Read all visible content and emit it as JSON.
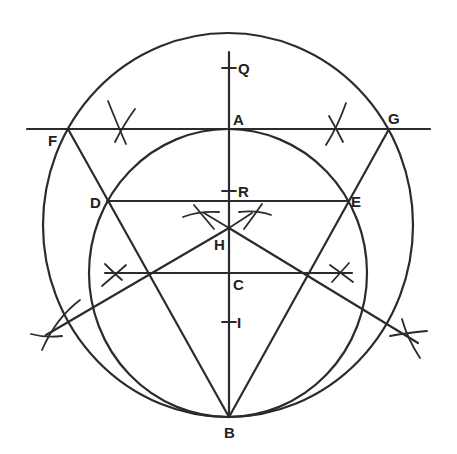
{
  "figure": {
    "stroke_color": "#2b2b2b",
    "background": "#ffffff"
  },
  "labels": {
    "Q": "Q",
    "A": "A",
    "F": "F",
    "G": "G",
    "R": "R",
    "D": "D",
    "E": "E",
    "H": "H",
    "C": "C",
    "I": "I",
    "B": "B"
  }
}
